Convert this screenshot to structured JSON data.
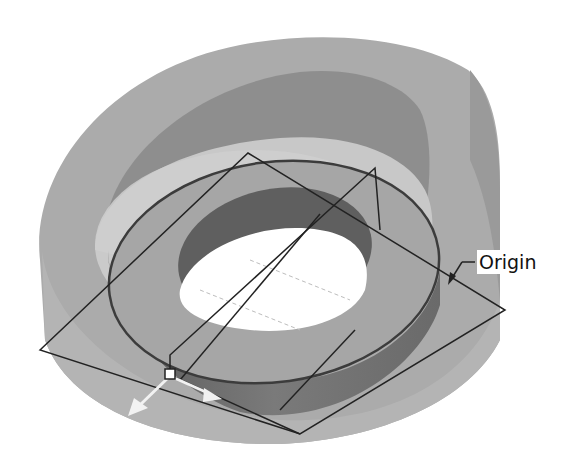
{
  "figure": {
    "type": "cad-model-view",
    "colors": {
      "background": "#ffffff",
      "outer_body": "#a9a9a9",
      "outer_body_dark": "#8f8f8f",
      "inner_wall": "#7d7d7d",
      "top_face": "#c9c9c9",
      "ring_top": "#a4a4a4",
      "ring_side": "#6e6e6e",
      "hole_wall": "#5f5f5f",
      "hole": "#ffffff",
      "plane_edge": "#222222",
      "arrow": "#f2f2f2"
    }
  },
  "annotations": {
    "origin_label": "Origin"
  }
}
